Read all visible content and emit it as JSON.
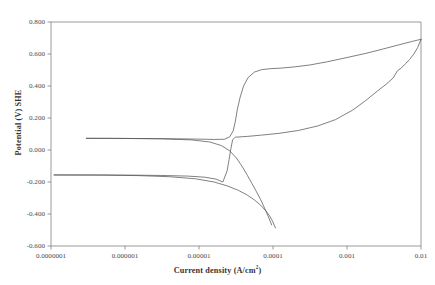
{
  "chart_data": {
    "type": "line",
    "title": "",
    "xlabel": "Current density (A/cm2)",
    "xlabel_base": "Current density (A/cm",
    "xlabel_sup": "2",
    "xlabel_tail": ")",
    "ylabel": "Potential (V) SHE",
    "xscale": "log",
    "xlim": [
      1e-07,
      0.01
    ],
    "ylim": [
      -0.6,
      0.8
    ],
    "grid": false,
    "legend": "none",
    "xticks": [
      1e-07,
      1e-06,
      1e-05,
      0.0001,
      0.001,
      0.01
    ],
    "xticklabels": [
      "0.0000001",
      "0.000001",
      "0.00001",
      "0.0001",
      "0.001",
      "0.01"
    ],
    "yticks": [
      -0.6,
      -0.4,
      -0.2,
      0.0,
      0.2,
      0.4,
      0.6,
      0.8
    ],
    "yticklabels": [
      "-0.600",
      "-0.400",
      "-0.200",
      "0.000",
      "0.200",
      "0.400",
      "0.600",
      "0.800"
    ],
    "line_color": "#555555",
    "axis_color": "#808080",
    "series": [
      {
        "name": "anodic-branch-upper",
        "comment": "upper anodic polarization curve: plateau near 0.07 V then steep active-passive rise to 0.50 V, slow rise to 0.69 V",
        "points": [
          [
            3e-07,
            0.073
          ],
          [
            6e-07,
            0.073
          ],
          [
            1.2e-06,
            0.072
          ],
          [
            2.5e-06,
            0.071
          ],
          [
            5e-06,
            0.07
          ],
          [
            1e-05,
            0.068
          ],
          [
            1.6e-05,
            0.066
          ],
          [
            2.2e-05,
            0.067
          ],
          [
            2.6e-05,
            0.082
          ],
          [
            2.9e-05,
            0.12
          ],
          [
            3.1e-05,
            0.18
          ],
          [
            3.3e-05,
            0.255
          ],
          [
            3.6e-05,
            0.33
          ],
          [
            4e-05,
            0.4
          ],
          [
            4.6e-05,
            0.452
          ],
          [
            5.6e-05,
            0.487
          ],
          [
            7e-05,
            0.502
          ],
          [
            9e-05,
            0.508
          ],
          [
            0.00013,
            0.512
          ],
          [
            0.0002,
            0.52
          ],
          [
            0.00032,
            0.532
          ],
          [
            0.00055,
            0.552
          ],
          [
            0.001,
            0.578
          ],
          [
            0.0018,
            0.604
          ],
          [
            0.003,
            0.63
          ],
          [
            0.005,
            0.657
          ],
          [
            0.0075,
            0.678
          ],
          [
            0.01,
            0.692
          ]
        ]
      },
      {
        "name": "cathodic-branch-upper",
        "comment": "from the 0.07 V plateau descending through crossover toward -0.45 V",
        "points": [
          [
            3e-07,
            0.073
          ],
          [
            1e-06,
            0.072
          ],
          [
            3e-06,
            0.07
          ],
          [
            8e-06,
            0.063
          ],
          [
            1.4e-05,
            0.05
          ],
          [
            2e-05,
            0.028
          ],
          [
            2.6e-05,
            -0.005
          ],
          [
            3.2e-05,
            -0.05
          ],
          [
            3.8e-05,
            -0.1
          ],
          [
            4.5e-05,
            -0.158
          ],
          [
            5.2e-05,
            -0.21
          ],
          [
            6e-05,
            -0.262
          ],
          [
            6.8e-05,
            -0.31
          ],
          [
            7.5e-05,
            -0.352
          ],
          [
            8.2e-05,
            -0.392
          ],
          [
            8.8e-05,
            -0.425
          ],
          [
            9.3e-05,
            -0.452
          ],
          [
            9.6e-05,
            -0.468
          ]
        ]
      },
      {
        "name": "anodic-branch-lower",
        "comment": "lower curve rising from -0.155 V plateau steeply through crossover up to 0.69 V",
        "points": [
          [
            1.1e-07,
            -0.156
          ],
          [
            4e-07,
            -0.156
          ],
          [
            1.2e-06,
            -0.157
          ],
          [
            3e-06,
            -0.159
          ],
          [
            7e-06,
            -0.163
          ],
          [
            1.2e-05,
            -0.17
          ],
          [
            1.7e-05,
            -0.182
          ],
          [
            2.1e-05,
            -0.2
          ],
          [
            2.4e-05,
            -0.13
          ],
          [
            2.55e-05,
            -0.06
          ],
          [
            2.7e-05,
            0.01
          ],
          [
            2.85e-05,
            0.065
          ],
          [
            3.1e-05,
            0.08
          ],
          [
            4.5e-05,
            0.085
          ],
          [
            7e-05,
            0.093
          ],
          [
            0.00012,
            0.104
          ],
          [
            0.00022,
            0.122
          ],
          [
            0.0004,
            0.15
          ],
          [
            0.0007,
            0.19
          ],
          [
            0.0012,
            0.25
          ],
          [
            0.0018,
            0.31
          ],
          [
            0.0026,
            0.37
          ],
          [
            0.0034,
            0.412
          ],
          [
            0.0042,
            0.45
          ],
          [
            0.0048,
            0.495
          ],
          [
            0.0054,
            0.512
          ],
          [
            0.0062,
            0.54
          ],
          [
            0.007,
            0.565
          ],
          [
            0.008,
            0.6
          ],
          [
            0.009,
            0.64
          ],
          [
            0.01,
            0.692
          ]
        ]
      },
      {
        "name": "cathodic-branch-lower",
        "comment": "lower cathodic branch from -0.155 V plateau sloping down to -0.49 V",
        "points": [
          [
            1.1e-07,
            -0.156
          ],
          [
            5e-07,
            -0.157
          ],
          [
            1.5e-06,
            -0.16
          ],
          [
            4e-06,
            -0.167
          ],
          [
            9e-06,
            -0.18
          ],
          [
            1.6e-05,
            -0.2
          ],
          [
            2.4e-05,
            -0.224
          ],
          [
            3.4e-05,
            -0.252
          ],
          [
            4.5e-05,
            -0.282
          ],
          [
            5.6e-05,
            -0.312
          ],
          [
            6.8e-05,
            -0.345
          ],
          [
            8e-05,
            -0.38
          ],
          [
            9e-05,
            -0.412
          ],
          [
            9.8e-05,
            -0.442
          ],
          [
            0.000104,
            -0.47
          ],
          [
            0.000108,
            -0.487
          ]
        ]
      }
    ]
  },
  "plot_geometry": {
    "left": 51,
    "right": 421,
    "top": 22,
    "bottom": 246
  }
}
